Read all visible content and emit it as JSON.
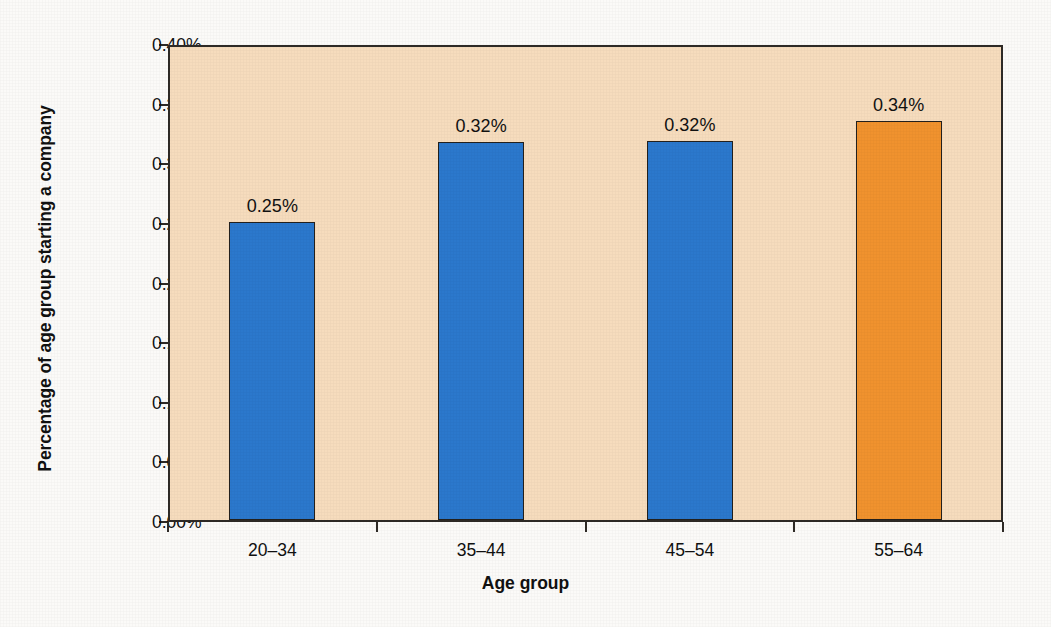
{
  "chart_data": {
    "type": "bar",
    "title": "",
    "xlabel": "Age group",
    "ylabel": "Percentage of age group starting a company",
    "categories": [
      "20–34",
      "35–44",
      "45–54",
      "55–64"
    ],
    "values": [
      0.25,
      0.317,
      0.318,
      0.335
    ],
    "data_labels": [
      "0.25%",
      "0.32%",
      "0.32%",
      "0.34%"
    ],
    "bar_colors": [
      "#2b78cc",
      "#2b78cc",
      "#2b78cc",
      "#f0922e"
    ],
    "ylim": [
      0,
      0.4
    ],
    "ytick_values": [
      0.0,
      0.05,
      0.1,
      0.15,
      0.2,
      0.25,
      0.3,
      0.35,
      0.4
    ],
    "ytick_labels": [
      "0.00%",
      "0.05%",
      "0.10%",
      "0.15%",
      "0.20%",
      "0.25%",
      "0.30%",
      "0.35%",
      "0.40%"
    ],
    "grid": false,
    "legend": null,
    "plot_background": "#f6dcbd",
    "page_background": "#fbfaf8",
    "axis_color": "#2e2a26",
    "highlight_color": "#f0922e",
    "series_color": "#2b78cc"
  }
}
